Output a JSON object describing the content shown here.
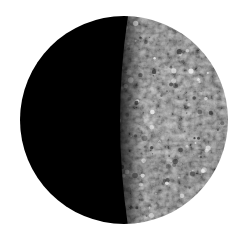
{
  "image": {
    "subject": "Mercury, partially illuminated planet",
    "description": "Half-lit rocky planet with cratered grey surface on the right and dark night side on the left, on a white background",
    "colors": {
      "background": "#ffffff",
      "night_side": "#000000",
      "lit_surface_light": "#d8d8d8",
      "lit_surface_mid": "#9a9a9a",
      "lit_surface_dark": "#555555"
    },
    "illumination": "right side lit, terminator near center"
  }
}
